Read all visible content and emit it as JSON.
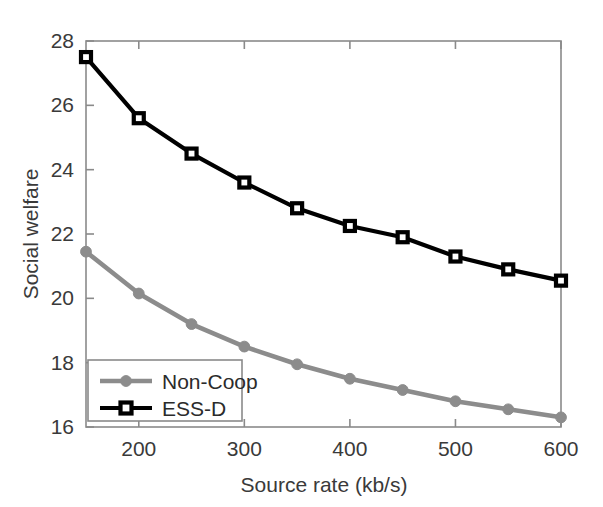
{
  "chart_data": {
    "type": "line",
    "title": "",
    "xlabel": "Source rate (kb/s)",
    "ylabel": "Social welfare",
    "xlim": [
      150,
      600
    ],
    "ylim": [
      16,
      28
    ],
    "xticks": [
      200,
      300,
      400,
      500,
      600
    ],
    "yticks": [
      16,
      18,
      20,
      22,
      24,
      26,
      28
    ],
    "xtick_labels": [
      "200",
      "300",
      "400",
      "500",
      "600"
    ],
    "ytick_labels": [
      "16",
      "18",
      "20",
      "22",
      "24",
      "26",
      "28"
    ],
    "grid": false,
    "legend_position": "lower left",
    "x": [
      150,
      200,
      250,
      300,
      350,
      400,
      450,
      500,
      550,
      600
    ],
    "series": [
      {
        "name": "Non-Coop",
        "color": "#8c8c8c",
        "marker": "circle",
        "values": [
          21.45,
          20.15,
          19.2,
          18.5,
          17.95,
          17.5,
          17.15,
          16.8,
          16.55,
          16.3
        ]
      },
      {
        "name": "ESS-D",
        "color": "#000000",
        "marker": "square",
        "values": [
          27.5,
          25.6,
          24.5,
          23.6,
          22.8,
          22.25,
          21.9,
          21.3,
          20.9,
          20.55
        ]
      }
    ]
  },
  "axes": {
    "y_axis_title": "Social welfare",
    "x_axis_title": "Source rate (kb/s)"
  },
  "legend": {
    "entries": [
      {
        "label": "Non-Coop",
        "color": "#8c8c8c",
        "marker": "circle"
      },
      {
        "label": "ESS-D",
        "color": "#000000",
        "marker": "square"
      }
    ]
  },
  "colors": {
    "non_coop": "#8c8c8c",
    "ess_d": "#000000",
    "frame": "#8a8a8a",
    "text": "#3a3a3a",
    "background": "#ffffff"
  }
}
